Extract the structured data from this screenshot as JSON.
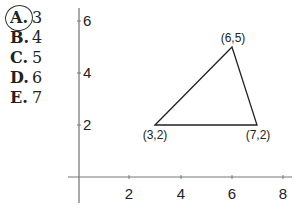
{
  "question": {
    "choices": [
      {
        "letter": "A.",
        "value": "3",
        "selected": true
      },
      {
        "letter": "B.",
        "value": "4",
        "selected": false
      },
      {
        "letter": "C.",
        "value": "5",
        "selected": false
      },
      {
        "letter": "D.",
        "value": "6",
        "selected": false
      },
      {
        "letter": "E.",
        "value": "7",
        "selected": false
      }
    ]
  },
  "graph": {
    "x_ticks": [
      "2",
      "4",
      "6",
      "8"
    ],
    "y_ticks": [
      "2",
      "4",
      "6"
    ],
    "vertices": [
      {
        "label": "(3,2)",
        "x": 3,
        "y": 2
      },
      {
        "label": "(6,5)",
        "x": 6,
        "y": 5
      },
      {
        "label": "(7,2)",
        "x": 7,
        "y": 2
      }
    ]
  }
}
